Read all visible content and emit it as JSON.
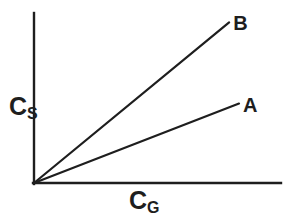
{
  "figure": {
    "background": "#ffffff",
    "ink_color": "#1e1e1e"
  },
  "chart_data": {
    "type": "line",
    "title": "",
    "xlabel": "C_G",
    "ylabel": "C_S",
    "xlabel_parts": {
      "main": "C",
      "sub": "G"
    },
    "ylabel_parts": {
      "main": "C",
      "sub": "S"
    },
    "xlim": [
      0,
      1
    ],
    "ylim": [
      0,
      1
    ],
    "grid": false,
    "axis_ticks": "none",
    "legend_position": "labels-at-line-ends",
    "series": [
      {
        "name": "B",
        "points": [
          [
            0,
            0
          ],
          [
            0.79,
            0.95
          ]
        ]
      },
      {
        "name": "A",
        "points": [
          [
            0,
            0
          ],
          [
            0.83,
            0.47
          ]
        ]
      }
    ]
  }
}
